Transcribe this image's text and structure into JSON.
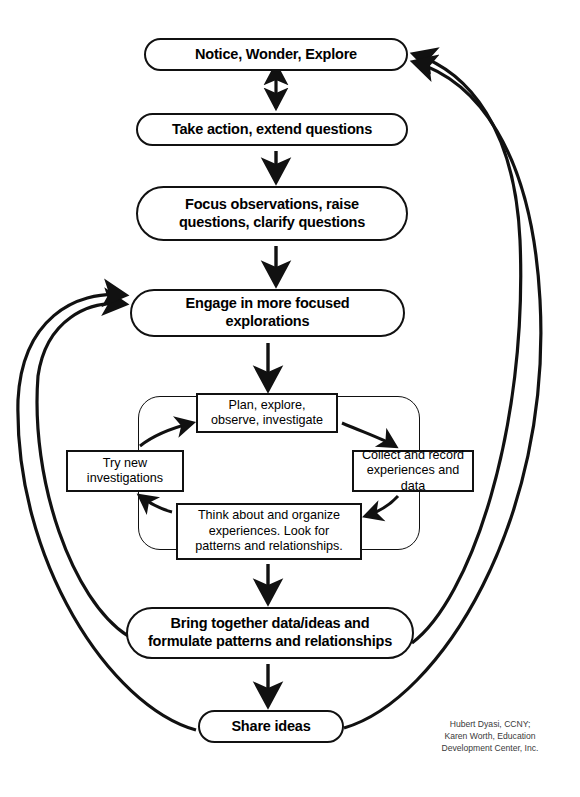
{
  "diagram": {
    "credit_lines": [
      "Hubert Dyasi, CCNY;",
      "Karen Worth, Education",
      "Development Center, Inc."
    ],
    "credit_text": "Hubert Dyasi, CCNY;\nKaren Worth, Education\nDevelopment Center, Inc.",
    "colors": {
      "stroke": "#111111",
      "background": "#ffffff",
      "text": "#000000",
      "credit_text": "#3a3a3a"
    }
  },
  "main_nodes": [
    {
      "id": "notice",
      "label": "Notice, Wonder, Explore",
      "shape": "pill"
    },
    {
      "id": "take",
      "label": "Take action, extend questions",
      "shape": "pill"
    },
    {
      "id": "focus",
      "label": "Focus observations, raise questions, clarify questions",
      "shape": "pill",
      "line1": "Focus observations, raise",
      "line2": "questions, clarify questions"
    },
    {
      "id": "engage",
      "label": "Engage in more focused explorations",
      "shape": "pill",
      "line1": "Engage in more focused",
      "line2": "explorations"
    },
    {
      "id": "bring",
      "label": "Bring together data/ideas and formulate patterns and relationships",
      "shape": "pill",
      "line1": "Bring together data/ideas and",
      "line2": "formulate patterns and relationships"
    },
    {
      "id": "share",
      "label": "Share ideas",
      "shape": "pill"
    }
  ],
  "cycle_nodes": [
    {
      "id": "plan",
      "label": "Plan, explore, observe, investigate",
      "shape": "rect",
      "line1": "Plan, explore,",
      "line2": "observe, investigate"
    },
    {
      "id": "collect",
      "label": "Collect and record experiences and data",
      "shape": "rect",
      "line1": "Collect and record",
      "line2": "experiences and data"
    },
    {
      "id": "think",
      "label": "Think about and organize experiences. Look for patterns and relationships.",
      "shape": "rect",
      "line1": "Think about and organize",
      "line2": "experiences. Look for",
      "line3": "patterns and relationships."
    },
    {
      "id": "try",
      "label": "Try new investigations",
      "shape": "rect",
      "line1": "Try new",
      "line2": "investigations"
    }
  ],
  "connections": [
    {
      "from": "notice",
      "to": "take",
      "type": "double-arrow",
      "orientation": "vertical"
    },
    {
      "from": "take",
      "to": "focus",
      "type": "arrow",
      "orientation": "vertical"
    },
    {
      "from": "focus",
      "to": "engage",
      "type": "arrow",
      "orientation": "vertical"
    },
    {
      "from": "engage",
      "to": "plan",
      "type": "arrow",
      "orientation": "vertical"
    },
    {
      "from": "plan",
      "to": "collect",
      "type": "curved-arrow",
      "orientation": "clockwise"
    },
    {
      "from": "collect",
      "to": "think",
      "type": "curved-arrow",
      "orientation": "clockwise"
    },
    {
      "from": "think",
      "to": "try",
      "type": "curved-arrow",
      "orientation": "clockwise"
    },
    {
      "from": "try",
      "to": "plan",
      "type": "curved-arrow",
      "orientation": "clockwise"
    },
    {
      "from": "think",
      "to": "bring",
      "type": "arrow",
      "orientation": "vertical"
    },
    {
      "from": "bring",
      "to": "share",
      "type": "arrow",
      "orientation": "vertical"
    },
    {
      "from": "bring",
      "to": "notice",
      "type": "long-curve",
      "orientation": "right"
    },
    {
      "from": "share",
      "to": "notice",
      "type": "long-curve",
      "orientation": "right"
    },
    {
      "from": "bring",
      "to": "engage",
      "type": "long-curve",
      "orientation": "left"
    },
    {
      "from": "share",
      "to": "engage",
      "type": "long-curve",
      "orientation": "left"
    }
  ]
}
